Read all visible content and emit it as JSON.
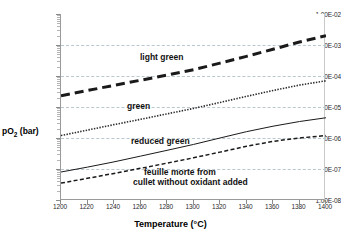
{
  "chart_data": {
    "type": "line",
    "title": "",
    "xlabel": "Temperature (°C)",
    "ylabel": "pO2 (bar)",
    "ylabel_base": "pO",
    "ylabel_sub": "2",
    "ylabel_unit": " (bar)",
    "xlim": [
      1200,
      1400
    ],
    "ylim": [
      1e-08,
      0.01
    ],
    "yscale": "log",
    "grid": true,
    "legend_position": "inline-annotations",
    "x": [
      1200,
      1220,
      1240,
      1260,
      1280,
      1300,
      1320,
      1340,
      1360,
      1380,
      1400
    ],
    "xticks": [
      "1200",
      "1220",
      "1240",
      "1260",
      "1280",
      "1300",
      "1320",
      "1340",
      "1360",
      "1380",
      "1400"
    ],
    "yticks": [
      "1.00E-02",
      "1.00E-03",
      "1.00E-04",
      "1.00E-05",
      "1.00E-06",
      "1.00E-07",
      "1.00E-08"
    ],
    "ytick_values": [
      0.01,
      0.001,
      0.0001,
      1e-05,
      1e-06,
      1e-07,
      1e-08
    ],
    "series": [
      {
        "name": "light green",
        "style": "thick-dashed",
        "color": "#1a1a1a",
        "values": [
          2.3e-05,
          3.4e-05,
          5e-05,
          7.3e-05,
          0.000107,
          0.00016,
          0.00026,
          0.00043,
          0.00073,
          0.00125,
          0.002
        ]
      },
      {
        "name": "green",
        "style": "dotted",
        "color": "#2a2a2a",
        "values": [
          1.2e-06,
          1.8e-06,
          2.7e-06,
          4e-06,
          6e-06,
          9e-06,
          1.4e-05,
          2.2e-05,
          3.4e-05,
          5.1e-05,
          7e-05
        ]
      },
      {
        "name": "reduced green",
        "style": "solid",
        "color": "#1a1a1a",
        "values": [
          8e-08,
          1.15e-07,
          1.7e-07,
          2.6e-07,
          4e-07,
          6.2e-07,
          1e-06,
          1.6e-06,
          2.4e-06,
          3.4e-06,
          4.5e-06
        ]
      },
      {
        "name": "feuille morte from cullet without oxidant added",
        "style": "dashed",
        "color": "#1a1a1a",
        "values": [
          3.5e-08,
          5e-08,
          7.2e-08,
          1.05e-07,
          1.55e-07,
          2.3e-07,
          3.5e-07,
          5.4e-07,
          7.8e-07,
          1e-06,
          1.2e-06
        ]
      }
    ],
    "annotations": [
      {
        "text": "light green",
        "x": 1290,
        "y": 0.0003
      },
      {
        "text": "green",
        "x": 1255,
        "y": 1.2e-05
      },
      {
        "text": "reduced green",
        "x": 1258,
        "y": 1.3e-06
      },
      {
        "text": "feuille morte from",
        "x": 1268,
        "y": 1.1e-07
      },
      {
        "text": "cullet without oxidant added",
        "x": 1260,
        "y": 6.5e-08
      }
    ]
  },
  "axes": {
    "y_title_base": "pO",
    "y_title_sub": "2",
    "y_title_unit": " (bar)",
    "x_title": "Temperature (°C)"
  },
  "labels": {
    "light_green": "light green",
    "green": "green",
    "reduced_green": "reduced green",
    "feuille_line1": "feuille morte from",
    "feuille_line2": "cullet without oxidant added"
  },
  "colors": {
    "axis": "#9a9a9a",
    "grid": "#b9c8cf",
    "text": "#000000",
    "line": "#1a1a1a"
  }
}
